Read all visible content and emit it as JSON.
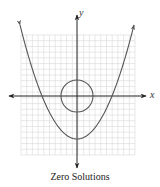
{
  "chart_data": {
    "type": "line",
    "title": "",
    "caption": "Zero Solutions",
    "xlabel": "x",
    "ylabel": "y",
    "grid": true,
    "grid_divisions": {
      "x": 20,
      "y": 21
    },
    "xlim": [
      -10,
      10
    ],
    "ylim": [
      -10,
      10
    ],
    "series": [
      {
        "name": "parabola",
        "shape": "upward parabola",
        "vertex": [
          0,
          -7.5
        ],
        "x_intercepts": [
          -6,
          6
        ],
        "arrows": "both ends",
        "equation_approx": "y = 0.21x^2 - 7.5"
      },
      {
        "name": "circle",
        "shape": "circle",
        "center": [
          0,
          0
        ],
        "radius": 2.8
      }
    ],
    "intersections": 0
  },
  "labels": {
    "x_axis": "x",
    "y_axis": "y",
    "caption": "Zero Solutions"
  },
  "colors": {
    "curve": "#555555",
    "axis": "#222222",
    "grid": "#d8d8d8"
  }
}
